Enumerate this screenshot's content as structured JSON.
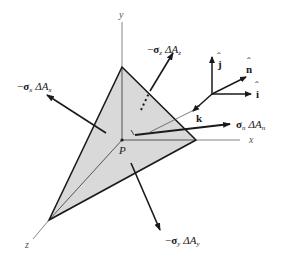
{
  "diagram": {
    "type": "free-body tetrahedron (Cauchy stress)",
    "colors": {
      "face_fill": "#d9d9d9",
      "edge": "#1a1a1a",
      "axis": "#666666",
      "arrow": "#1a1a1a"
    },
    "axes": {
      "x": {
        "label": "x"
      },
      "y": {
        "label": "y"
      },
      "z": {
        "label": "z"
      }
    },
    "point": {
      "label": "P"
    },
    "forces": [
      {
        "id": "neg-sigma-x",
        "sign": "−",
        "sigma": "σ",
        "sigma_sub": "x",
        "delta": "ΔA",
        "area_sub": "x"
      },
      {
        "id": "neg-sigma-y",
        "sign": "−",
        "sigma": "σ",
        "sigma_sub": "y",
        "delta": "ΔA",
        "area_sub": "y"
      },
      {
        "id": "neg-sigma-z",
        "sign": "−",
        "sigma": "σ",
        "sigma_sub": "z",
        "delta": "ΔA",
        "area_sub": "z"
      },
      {
        "id": "sigma-n",
        "sign": "",
        "sigma": "σ",
        "sigma_sub": "n",
        "delta": "ΔA",
        "area_sub": "n"
      }
    ],
    "unit_vectors": {
      "i": "î",
      "j": "ĵ",
      "k": "k̂",
      "n": "n̂",
      "i_letter": "i",
      "j_letter": "j",
      "k_letter": "k",
      "n_letter": "n",
      "hat": "ˆ"
    }
  }
}
